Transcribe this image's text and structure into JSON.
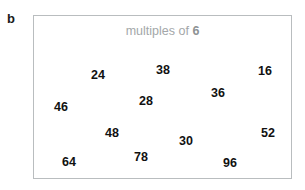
{
  "part_label": "b",
  "box": {
    "title_prefix": "multiples of",
    "title_value": "6",
    "border_color": "#b9bdbf",
    "background_color": "#ffffff",
    "title_color": "#a3a7a9"
  },
  "numbers": [
    {
      "value": "24",
      "x": 57,
      "y": 53
    },
    {
      "value": "38",
      "x": 122,
      "y": 48
    },
    {
      "value": "16",
      "x": 224,
      "y": 49
    },
    {
      "value": "46",
      "x": 20,
      "y": 85
    },
    {
      "value": "28",
      "x": 105,
      "y": 79
    },
    {
      "value": "36",
      "x": 177,
      "y": 71
    },
    {
      "value": "48",
      "x": 71,
      "y": 111
    },
    {
      "value": "30",
      "x": 145,
      "y": 119
    },
    {
      "value": "52",
      "x": 227,
      "y": 111
    },
    {
      "value": "64",
      "x": 28,
      "y": 140
    },
    {
      "value": "78",
      "x": 100,
      "y": 135
    },
    {
      "value": "96",
      "x": 189,
      "y": 141
    }
  ],
  "number_color": "#111111"
}
